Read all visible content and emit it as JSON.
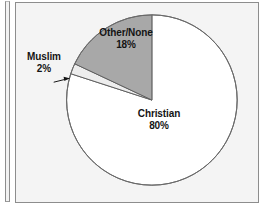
{
  "figure": {
    "panel_bg": "#f4f4f4",
    "border_color": "#8d8d8d"
  },
  "chart_data": {
    "type": "pie",
    "title": "",
    "subtitle": "",
    "xlabel": "",
    "ylabel": "",
    "grid": false,
    "legend_position": "none",
    "labels_on_slices": true,
    "start_angle_deg": 0,
    "direction": "clockwise",
    "categories": [
      "Christian",
      "Muslim",
      "Other/None"
    ],
    "values": [
      80,
      2,
      18
    ],
    "value_suffix": "%",
    "colors": [
      "#ffffff",
      "#ededed",
      "#a8a8a8"
    ],
    "slices": [
      {
        "name": "Christian",
        "value": 80,
        "value_text": "80%",
        "color": "#ffffff",
        "label_inside": true,
        "leader_line": false
      },
      {
        "name": "Muslim",
        "value": 2,
        "value_text": "2%",
        "color": "#ededed",
        "label_inside": false,
        "leader_line": true
      },
      {
        "name": "Other/None",
        "value": 18,
        "value_text": "18%",
        "color": "#a8a8a8",
        "label_inside": true,
        "leader_line": false
      }
    ]
  }
}
